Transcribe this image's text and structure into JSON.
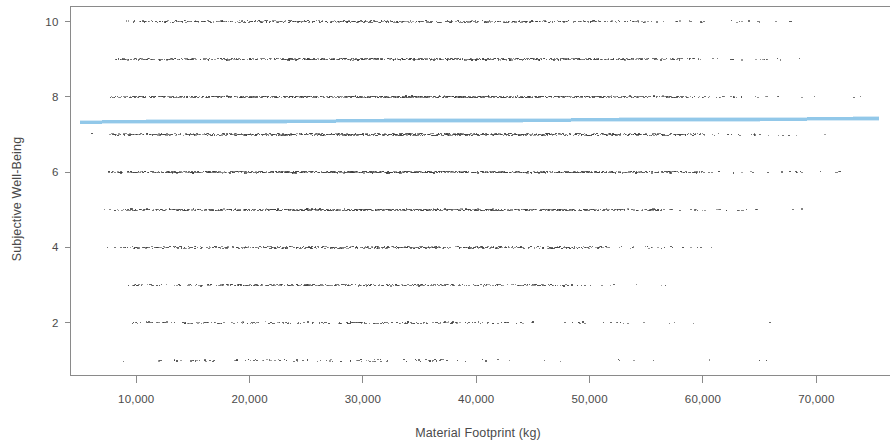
{
  "chart_data": {
    "type": "scatter",
    "title": "",
    "xlabel": "Material Footprint (kg)",
    "ylabel": "Subjective Well-Being",
    "xlim": [
      4200,
      76500
    ],
    "ylim": [
      0.6,
      10.4
    ],
    "grid": false,
    "legend": null,
    "x_ticks": [
      10000,
      20000,
      30000,
      40000,
      50000,
      60000,
      70000
    ],
    "x_tick_labels": [
      "10,000",
      "20,000",
      "30,000",
      "40,000",
      "50,000",
      "60,000",
      "70,000"
    ],
    "y_ticks": [
      2,
      4,
      6,
      8,
      10
    ],
    "y_tick_labels": [
      "2",
      "4",
      "6",
      "8",
      "10"
    ],
    "point_color": "#3a3a3a",
    "point_size": 1.1,
    "series": [
      {
        "name": "Respondents",
        "type": "scatter",
        "note": "Subjective Well-Being is an integer 1-10 scale, so points form ten horizontal bands; density is highest between roughly 7,000 and 55,000 kg and thins out toward 75,000 kg.",
        "bands": [
          {
            "y": 10,
            "x_start": 6200,
            "x_end": 76000,
            "density": 0.62,
            "dense_from": 9000,
            "dense_to": 55000
          },
          {
            "y": 9,
            "x_start": 6000,
            "x_end": 76000,
            "density": 0.78,
            "dense_from": 8000,
            "dense_to": 58000
          },
          {
            "y": 8,
            "x_start": 5600,
            "x_end": 76000,
            "density": 0.88,
            "dense_from": 7600,
            "dense_to": 60000
          },
          {
            "y": 7,
            "x_start": 5600,
            "x_end": 76000,
            "density": 0.95,
            "dense_from": 7400,
            "dense_to": 60000
          },
          {
            "y": 6,
            "x_start": 5600,
            "x_end": 76000,
            "density": 0.92,
            "dense_from": 7400,
            "dense_to": 60000
          },
          {
            "y": 5,
            "x_start": 5800,
            "x_end": 76000,
            "density": 0.8,
            "dense_from": 8000,
            "dense_to": 56000
          },
          {
            "y": 4,
            "x_start": 6000,
            "x_end": 74500,
            "density": 0.66,
            "dense_from": 8600,
            "dense_to": 52000
          },
          {
            "y": 3,
            "x_start": 6400,
            "x_end": 74000,
            "density": 0.48,
            "dense_from": 9200,
            "dense_to": 48000
          },
          {
            "y": 2,
            "x_start": 6600,
            "x_end": 72000,
            "density": 0.34,
            "dense_from": 9600,
            "dense_to": 45000
          },
          {
            "y": 1,
            "x_start": 5200,
            "x_end": 71000,
            "density": 0.17,
            "dense_from": 11000,
            "dense_to": 42000
          }
        ]
      },
      {
        "name": "Fitted regression line",
        "type": "line",
        "color": "#8ec6e8",
        "line_width": 3,
        "x": [
          5000,
          75500
        ],
        "y": [
          7.33,
          7.42
        ]
      }
    ]
  },
  "axes": {
    "x_title": "Material Footprint (kg)",
    "y_title": "Subjective Well-Being"
  },
  "ticks": {
    "x": [
      {
        "label": "10,000",
        "value": 10000
      },
      {
        "label": "20,000",
        "value": 20000
      },
      {
        "label": "30,000",
        "value": 30000
      },
      {
        "label": "40,000",
        "value": 40000
      },
      {
        "label": "50,000",
        "value": 50000
      },
      {
        "label": "60,000",
        "value": 60000
      },
      {
        "label": "70,000",
        "value": 70000
      }
    ],
    "y": [
      {
        "label": "2",
        "value": 2
      },
      {
        "label": "4",
        "value": 4
      },
      {
        "label": "6",
        "value": 6
      },
      {
        "label": "8",
        "value": 8
      },
      {
        "label": "10",
        "value": 10
      }
    ]
  },
  "colors": {
    "regression_line": "#8ec6e8",
    "points": "#3a3a3a",
    "frame": "#8a8a8a",
    "text": "#4a4a4a"
  }
}
